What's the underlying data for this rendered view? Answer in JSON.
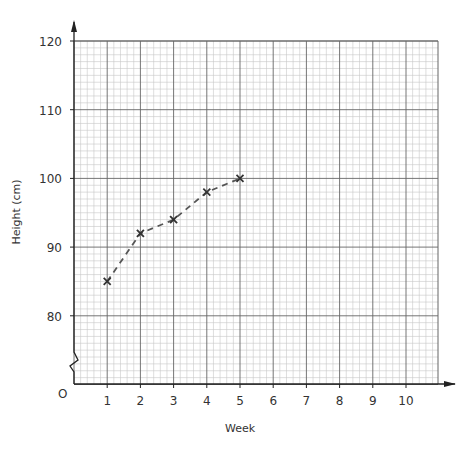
{
  "chart_data": {
    "type": "line",
    "title": "",
    "xlabel": "Week",
    "ylabel": "Height (cm)",
    "x": [
      1,
      2,
      3,
      4,
      5
    ],
    "series": [
      {
        "name": "Height",
        "values": [
          85,
          92,
          94,
          98,
          100
        ],
        "marker": "x",
        "line_style": "dashed",
        "color": "#555555"
      }
    ],
    "x_ticks": [
      "1",
      "2",
      "3",
      "4",
      "5",
      "6",
      "7",
      "8",
      "9",
      "10"
    ],
    "y_ticks": [
      "80",
      "90",
      "100",
      "110",
      "120"
    ],
    "origin_label": "O",
    "xlim": [
      0,
      11
    ],
    "ylim": [
      75,
      120
    ],
    "axis_break_on_y": true,
    "grid": true
  }
}
